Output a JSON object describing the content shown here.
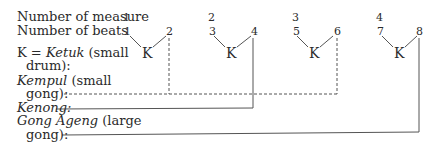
{
  "labels": {
    "measure": "Number of measure",
    "beats": "Number of beats",
    "ketuk_prefix": "K = ",
    "ketuk_name": "Ketuk",
    "ketuk_desc": " (small",
    "ketuk_desc2": "drum):",
    "kempul_name": "Kempul",
    "kempul_desc": " (small",
    "kempul_desc2": "gong):",
    "kenong_name": "Kenong:",
    "gong_name": "Gong Ageng",
    "gong_desc": " (large",
    "gong_desc2": "gong):"
  },
  "measures": [
    "1",
    "2",
    "3",
    "4"
  ],
  "beats": [
    "1",
    "2",
    "3",
    "4",
    "5",
    "6",
    "7",
    "8"
  ],
  "ketuk_symbol": "K",
  "colors": {
    "ink": "#2a2a2a",
    "line": "#555555"
  }
}
